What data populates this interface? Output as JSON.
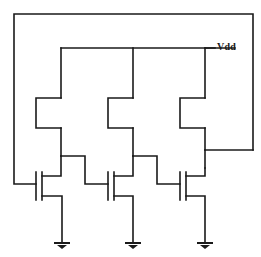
{
  "diagram": {
    "type": "circuit-schematic",
    "canvas": {
      "width": 261,
      "height": 257
    },
    "colors": {
      "background": "#ffffff",
      "wire": "#1a1a1a",
      "label": "#1a1a1a"
    },
    "labels": {
      "vdd": "Vdd"
    },
    "nets": [
      {
        "name": "vdd-rail",
        "label": "Vdd"
      },
      {
        "name": "gnd",
        "label": ""
      },
      {
        "name": "feedback-loop",
        "label": ""
      }
    ],
    "stages": [
      {
        "name": "stage-1",
        "load_device": "depletion-nmos-load",
        "driver_device": "enhancement-nmos-driver",
        "gate_input": "feedback-from-stage-3",
        "drain_output": "node-1"
      },
      {
        "name": "stage-2",
        "load_device": "depletion-nmos-load",
        "driver_device": "enhancement-nmos-driver",
        "gate_input": "node-1",
        "drain_output": "node-2"
      },
      {
        "name": "stage-3",
        "load_device": "depletion-nmos-load",
        "driver_device": "enhancement-nmos-driver",
        "gate_input": "node-2",
        "drain_output": "node-3"
      }
    ],
    "ground_symbols": [
      {
        "name": "ground-1",
        "x": 62,
        "y": 243
      },
      {
        "name": "ground-2",
        "x": 133,
        "y": 243
      },
      {
        "name": "ground-3",
        "x": 205,
        "y": 243
      }
    ],
    "vdd_label_position": {
      "x": 217,
      "y": 42
    }
  }
}
